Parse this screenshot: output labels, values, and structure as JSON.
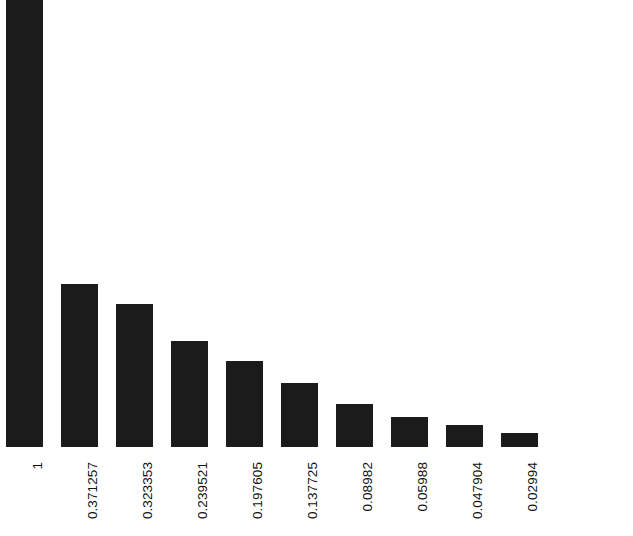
{
  "chart_data": {
    "type": "bar",
    "title": "",
    "subtitle": "",
    "xlabel": "",
    "ylabel": "",
    "categories": [
      "1",
      "0.371257",
      "0.323353",
      "0.239521",
      "0.197605",
      "0.137725",
      "0.08982",
      "0.05988",
      "0.047904",
      "0.02994"
    ],
    "values": [
      1,
      0.371257,
      0.323353,
      0.239521,
      0.197605,
      0.137725,
      0.08982,
      0.05988,
      0.047904,
      0.02994
    ],
    "tick_labels": [
      "1",
      "0.371257",
      "0.323353",
      "0.239521",
      "0.197605",
      "0.137725",
      "0.08982",
      "0.05988",
      "0.047904",
      "0.02994"
    ],
    "tick_label_rotation": 90,
    "legend": [],
    "legend_position": "none",
    "grid": false,
    "axis_visible": false,
    "ylim": [
      0,
      1
    ],
    "bar_color": "#1b1b1b",
    "background_color": "#ffffff",
    "text_color": "#111111"
  },
  "layout": {
    "baseline_y": 447,
    "bar_width": 37,
    "bar_pitch": 55,
    "first_bar_left": 6,
    "bar_tops": [
      0,
      284,
      304,
      341,
      361,
      383,
      404,
      417,
      425,
      433
    ],
    "canvas_width": 633,
    "canvas_height": 536
  }
}
